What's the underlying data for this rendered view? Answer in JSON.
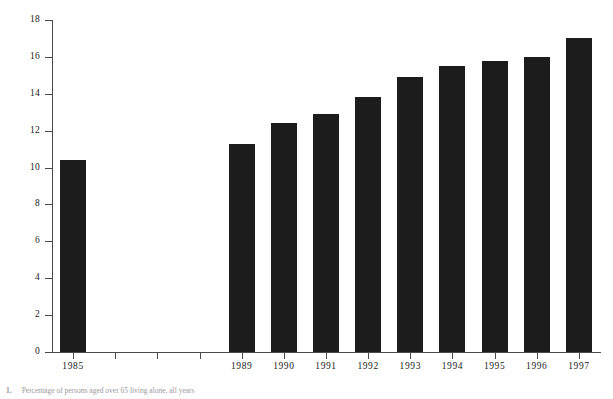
{
  "chart_data": {
    "type": "bar",
    "title": "",
    "subtitle": "",
    "xlabel": "",
    "ylabel": "Percentage",
    "categories": [
      "1985",
      "1986",
      "1987",
      "1988",
      "1989",
      "1990",
      "1991",
      "1992",
      "1993",
      "1994",
      "1995",
      "1996",
      "1997"
    ],
    "values": [
      10.4,
      null,
      null,
      null,
      11.3,
      12.4,
      12.9,
      13.8,
      14.9,
      15.5,
      15.8,
      16.0,
      17.0
    ],
    "visible_categories": [
      "1985",
      "1989",
      "1990",
      "1991",
      "1992",
      "1993",
      "1994",
      "1995",
      "1996",
      "1997"
    ],
    "visible_values": [
      10.4,
      11.3,
      12.4,
      12.9,
      13.8,
      14.9,
      15.5,
      15.8,
      16.0,
      17.0
    ],
    "ylim": [
      0,
      18
    ],
    "ytick_values": [
      0,
      2,
      4,
      6,
      8,
      10,
      12,
      14,
      16,
      18
    ],
    "ytick_labels": [
      "0",
      "2",
      "4",
      "6",
      "8",
      "10",
      "12",
      "14",
      "16",
      "18"
    ],
    "grid": false,
    "legend": null,
    "bar_color": "#1c1c1c",
    "axis_color": "#4a4a4a",
    "background_color": "#ffffff",
    "note": "Years 1986-1988 have tick positions but no bars"
  },
  "caption": {
    "number": "1.",
    "text": "Percentage of persons aged over 65 living alone, all years"
  }
}
